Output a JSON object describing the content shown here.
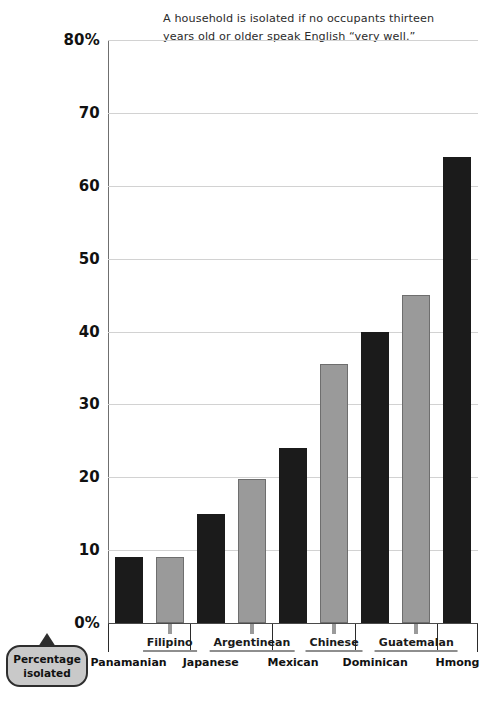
{
  "subtitle": {
    "line1": "A household is isolated if no occupants thirteen",
    "line2": "years old or older speak English “very well.”"
  },
  "callout": {
    "line1": "Percentage",
    "line2": "isolated"
  },
  "colors": {
    "dark_bar": "#1b1b1b",
    "light_bar": "#9a9a9a",
    "light_bar_outline": "#6e6e6e",
    "gridline": "#d2d2d2",
    "axis": "#6f6f6f",
    "callout_fill": "#c9c9c9",
    "callout_border": "#2e2e2e",
    "text": "#1a1a1a"
  },
  "chart_data": {
    "type": "bar",
    "title": "",
    "subtitle": "A household is isolated if no occupants thirteen years old or older speak English “very well.”",
    "xlabel": "",
    "ylabel": "Percentage isolated",
    "ylim": [
      0,
      80
    ],
    "ytick_labels": [
      "80%",
      "70",
      "60",
      "50",
      "40",
      "30",
      "20",
      "10",
      "0%"
    ],
    "yticks": [
      80,
      70,
      60,
      50,
      40,
      30,
      20,
      10,
      0
    ],
    "grid": "horizontal",
    "legend": "none",
    "categories": [
      "Panamanian",
      "Filipino",
      "Japanese",
      "Argentinean",
      "Mexican",
      "Chinese",
      "Dominican",
      "Guatemalan",
      "Hmong"
    ],
    "values": [
      9,
      9,
      15,
      19.8,
      24,
      35.5,
      40,
      45,
      64
    ],
    "bar_styles": [
      "dark",
      "light",
      "dark",
      "light",
      "dark",
      "light",
      "dark",
      "light",
      "dark"
    ],
    "label_rows": [
      "lower",
      "upper",
      "lower",
      "upper",
      "lower",
      "upper",
      "lower",
      "upper",
      "lower"
    ]
  }
}
